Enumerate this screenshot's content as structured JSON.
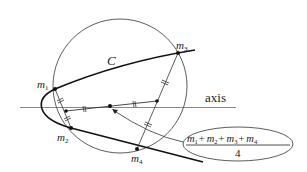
{
  "diagram": {
    "curve_label": "C",
    "axis_label": "axis",
    "points": [
      {
        "id": "m1",
        "base": "m",
        "sub": "1"
      },
      {
        "id": "m2",
        "base": "m",
        "sub": "2"
      },
      {
        "id": "m3",
        "base": "m",
        "sub": "3"
      },
      {
        "id": "m4",
        "base": "m",
        "sub": "4"
      }
    ],
    "centroid_label": {
      "numerator": [
        "m",
        "1",
        "+",
        "m",
        "2",
        "+",
        "m",
        "3",
        "+",
        "m",
        "4"
      ],
      "numerator_text": "m1 + m2 + m3 + m4",
      "denominator": "4"
    },
    "colors": {
      "stroke": "#222222",
      "background": "#ffffff"
    }
  }
}
